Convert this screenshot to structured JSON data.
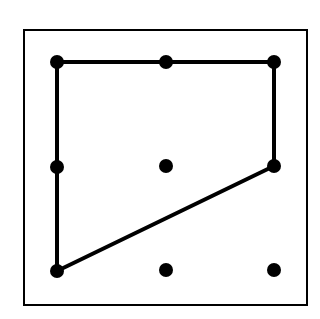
{
  "diagram": {
    "type": "geoboard",
    "grid_size": "3x3",
    "colors": {
      "background": "#ffffff",
      "ink": "#000000"
    },
    "frame": {
      "x": 24,
      "y": 30,
      "width": 283,
      "height": 275
    },
    "pegs": [
      {
        "row": 0,
        "col": 0,
        "x": 57,
        "y": 62
      },
      {
        "row": 0,
        "col": 1,
        "x": 166,
        "y": 62
      },
      {
        "row": 0,
        "col": 2,
        "x": 274,
        "y": 62
      },
      {
        "row": 1,
        "col": 0,
        "x": 57,
        "y": 167
      },
      {
        "row": 1,
        "col": 1,
        "x": 166,
        "y": 166
      },
      {
        "row": 1,
        "col": 2,
        "x": 274,
        "y": 166
      },
      {
        "row": 2,
        "col": 0,
        "x": 57,
        "y": 271
      },
      {
        "row": 2,
        "col": 1,
        "x": 166,
        "y": 270
      },
      {
        "row": 2,
        "col": 2,
        "x": 274,
        "y": 270
      }
    ],
    "polygon": {
      "shape": "quadrilateral",
      "vertices": [
        [
          57,
          62
        ],
        [
          274,
          62
        ],
        [
          274,
          166
        ],
        [
          57,
          271
        ]
      ]
    }
  }
}
